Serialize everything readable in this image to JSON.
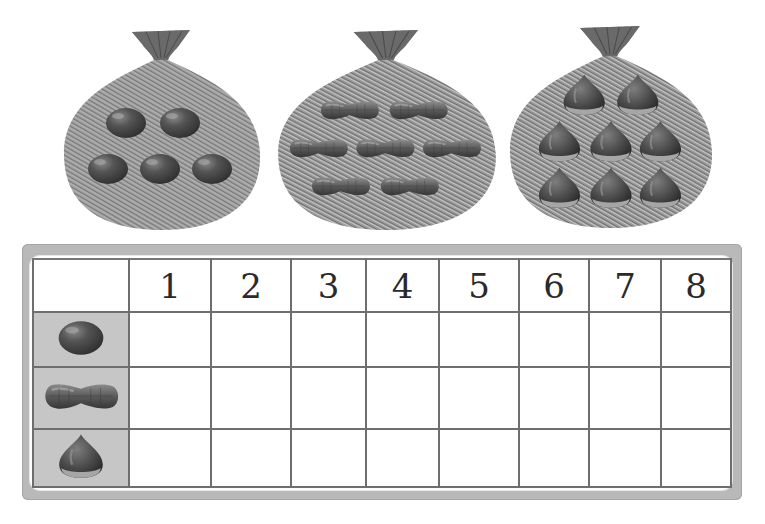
{
  "worksheet": {
    "bags": [
      {
        "item": "bean",
        "count": 5,
        "layout_rows": [
          2,
          3
        ]
      },
      {
        "item": "peanut",
        "count": 7,
        "layout_rows": [
          2,
          3,
          2
        ]
      },
      {
        "item": "chestnut",
        "count": 8,
        "layout_rows": [
          2,
          3,
          3
        ]
      }
    ],
    "table": {
      "column_headers": [
        "1",
        "2",
        "3",
        "4",
        "5",
        "6",
        "7",
        "8"
      ],
      "rows": [
        {
          "item": "bean",
          "icon": "bean-icon",
          "cells": [
            "",
            "",
            "",
            "",
            "",
            "",
            "",
            ""
          ]
        },
        {
          "item": "peanut",
          "icon": "peanut-icon",
          "cells": [
            "",
            "",
            "",
            "",
            "",
            "",
            "",
            ""
          ]
        },
        {
          "item": "chestnut",
          "icon": "chestnut-icon",
          "cells": [
            "",
            "",
            "",
            "",
            "",
            "",
            "",
            ""
          ]
        }
      ]
    },
    "colors": {
      "frame": "#b9b9b9",
      "label_cell": "#c6c6c6",
      "grid_line": "#6e6e6e",
      "bag": "#8a8a8a",
      "item": "#4a4a4a"
    }
  }
}
